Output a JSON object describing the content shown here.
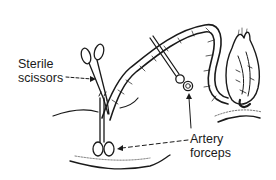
{
  "diagram": {
    "labels": {
      "scissors_line1": "Sterile",
      "scissors_line2": "scissors",
      "forceps_line1": "Artery",
      "forceps_line2": "forceps"
    },
    "colors": {
      "ink": "#1a1a1a",
      "background": "#ffffff"
    }
  }
}
